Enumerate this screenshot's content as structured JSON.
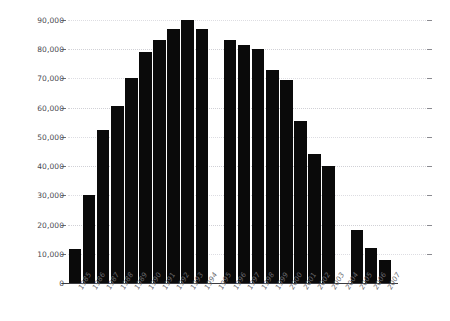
{
  "chart_data": {
    "type": "bar",
    "title": "",
    "subtitle": "",
    "xlabel": "",
    "ylabel": "",
    "categories": [
      "1985",
      "1986",
      "1987",
      "1988",
      "1989",
      "1990",
      "1991",
      "1992",
      "1993",
      "1994",
      "1995",
      "1996",
      "1997",
      "1998",
      "1999",
      "2000",
      "2001",
      "2002",
      "2003",
      "2004",
      "2005",
      "2006",
      "2007"
    ],
    "values": [
      11500,
      30000,
      52500,
      60500,
      70000,
      79000,
      83000,
      87000,
      90000,
      87000,
      null,
      83000,
      81500,
      80000,
      73000,
      69500,
      55500,
      44000,
      40000,
      null,
      18000,
      12000,
      8000
    ],
    "ylim": [
      0,
      90000
    ],
    "ytick_values": [
      0,
      10000,
      20000,
      30000,
      40000,
      50000,
      60000,
      70000,
      80000,
      90000
    ],
    "ytick_labels": [
      "0",
      "10,000",
      "20,000",
      "30,000",
      "40,000",
      "50,000",
      "60,000",
      "70,000",
      "80,000",
      "90,000"
    ],
    "grid": true,
    "grid_style": "dotted-horizontal",
    "legend": false,
    "legend_position": "none",
    "bar_color": "#0a0a0a",
    "grid_color": "#c9c9cf",
    "axis_color": "#3b3b40",
    "label_color": "#4a4a50",
    "missing_categories": [
      "1995",
      "2004"
    ],
    "xlabel_rotation_deg": -60,
    "annotations": []
  }
}
